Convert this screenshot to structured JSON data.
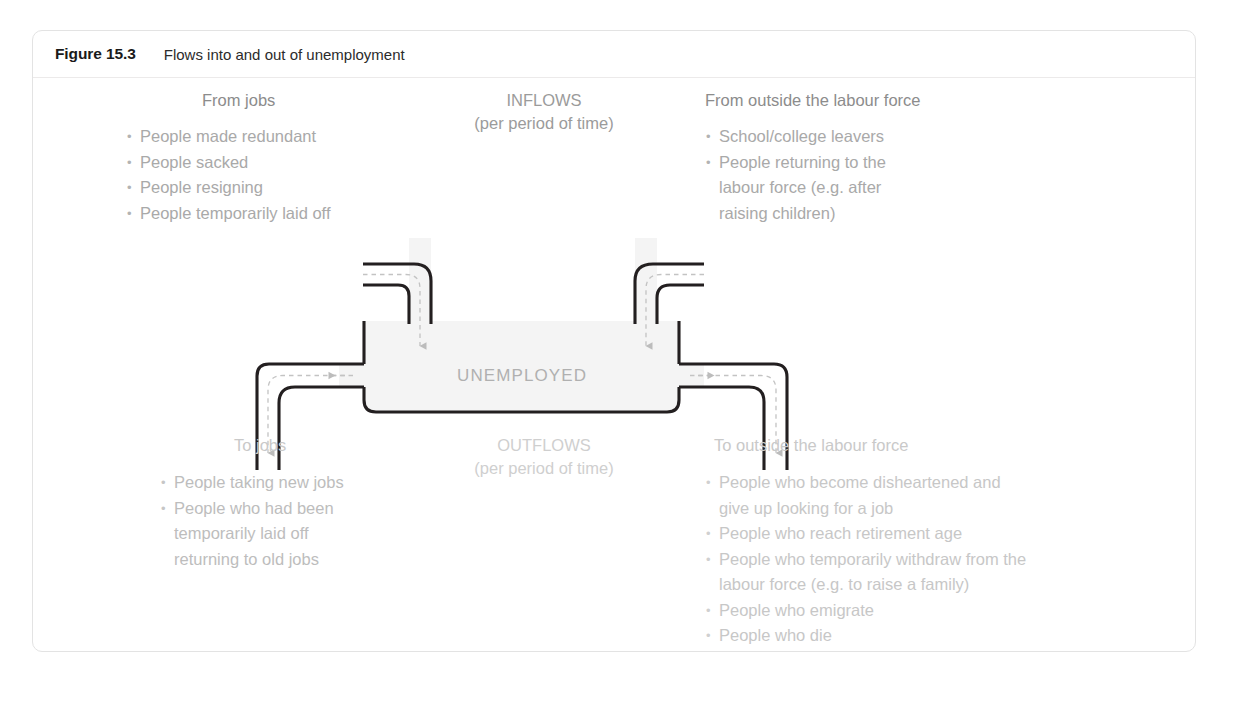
{
  "figure": {
    "number": "Figure 15.3",
    "caption": "Flows into and out of unemployment"
  },
  "colors": {
    "pipe_wall": "#231f20",
    "flow_arrow": "#b9b9b9",
    "tank_fill": "#f4f4f4",
    "text_gray": "#a9a9a9",
    "heading_gray": "#8c8c8c",
    "card_border": "#e3e3e3"
  },
  "tank": {
    "label": "UNEMPLOYED"
  },
  "inflows": {
    "title": "INFLOWS",
    "subtitle": "(per period of time)"
  },
  "outflows": {
    "title": "OUTFLOWS",
    "subtitle": "(per period of time)"
  },
  "from_jobs": {
    "heading": "From jobs",
    "items": [
      "People made redundant",
      "People sacked",
      "People resigning",
      "People temporarily laid off"
    ]
  },
  "from_outside": {
    "heading": "From outside the labour force",
    "items": [
      {
        "line1": "School/college leavers"
      },
      {
        "line1": "People returning to the",
        "line2": "labour force (e.g. after",
        "line3": "raising children)"
      }
    ]
  },
  "to_jobs": {
    "heading": "To jobs",
    "items": [
      {
        "line1": "People taking new jobs"
      },
      {
        "line1": "People who had been",
        "line2": "temporarily laid off",
        "line3": "returning to old jobs"
      }
    ]
  },
  "to_outside": {
    "heading": "To outside the labour force",
    "items": [
      {
        "line1": "People who become disheartened and",
        "line2": "give up looking for a job"
      },
      {
        "line1": "People who reach retirement age"
      },
      {
        "line1": "People who temporarily withdraw from the",
        "line2": "labour force (e.g. to raise a family)"
      },
      {
        "line1": "People who emigrate"
      },
      {
        "line1": "People who die"
      }
    ]
  },
  "icons": {
    "inflow_left": "arrow-down-icon",
    "inflow_right": "arrow-down-icon",
    "outflow_left": "arrow-left-icon",
    "outflow_right": "arrow-right-icon"
  }
}
